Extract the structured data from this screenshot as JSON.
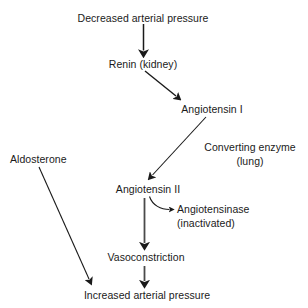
{
  "diagram": {
    "stroke_color": "#1a1a1a",
    "text_color": "#1a1a1a",
    "background_color": "#ffffff",
    "nodes": [
      {
        "id": "decreased-arterial-pressure",
        "label": "Decreased arterial pressure"
      },
      {
        "id": "renin-kidney",
        "label": "Renin (kidney)"
      },
      {
        "id": "angiotensin-i",
        "label": "Angiotensin I"
      },
      {
        "id": "converting-enzyme",
        "label": "Converting enzyme"
      },
      {
        "id": "converting-enzyme-site",
        "label": "(lung)"
      },
      {
        "id": "aldosterone",
        "label": "Aldosterone"
      },
      {
        "id": "angiotensin-ii",
        "label": "Angiotensin II"
      },
      {
        "id": "angiotensinase",
        "label": "Angiotensinase"
      },
      {
        "id": "angiotensinase-state",
        "label": "(inactivated)"
      },
      {
        "id": "vasoconstriction",
        "label": "Vasoconstriction"
      },
      {
        "id": "increased-arterial-pressure",
        "label": "Increased arterial pressure"
      }
    ],
    "edges": [
      {
        "id": "pressure-to-renin",
        "from": "decreased-arterial-pressure",
        "to": "renin-kidney",
        "style": "straight"
      },
      {
        "id": "renin-to-angiotensin-i",
        "from": "renin-kidney",
        "to": "angiotensin-i",
        "style": "straight"
      },
      {
        "id": "angiotensin-i-to-angiotensin-ii",
        "from": "angiotensin-i",
        "to": "angiotensin-ii",
        "style": "straight"
      },
      {
        "id": "angiotensin-ii-to-angiotensinase",
        "from": "angiotensin-ii",
        "to": "angiotensinase",
        "style": "curved"
      },
      {
        "id": "angiotensin-ii-to-vasoconstriction",
        "from": "angiotensin-ii",
        "to": "vasoconstriction",
        "style": "straight"
      },
      {
        "id": "vasoconstriction-to-pressure",
        "from": "vasoconstriction",
        "to": "increased-arterial-pressure",
        "style": "straight"
      },
      {
        "id": "aldosterone-to-pressure",
        "from": "aldosterone",
        "to": "increased-arterial-pressure",
        "style": "straight"
      }
    ]
  }
}
